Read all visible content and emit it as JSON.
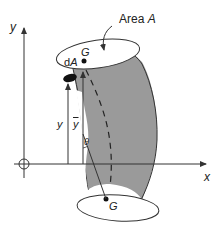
{
  "diagram": {
    "type": "curved-tube-centroid",
    "labels": {
      "area": "Area",
      "area_var": "A",
      "dA_d": "d",
      "dA_A": "A",
      "G_top": "G",
      "G_bottom": "G",
      "y_axis": "y",
      "x_axis": "x",
      "y_dist": "y",
      "ybar": "y",
      "theta": "θ"
    },
    "colors": {
      "shade": "#9a9a9a",
      "line": "#333333",
      "background": "#ffffff"
    }
  }
}
